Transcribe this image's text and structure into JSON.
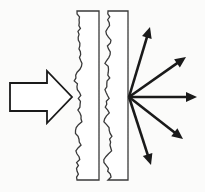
{
  "figure": {
    "title": "Wave scattering from a rough double-layer barrier",
    "domain": "diagram",
    "canvas": {
      "width": 205,
      "height": 192
    },
    "background_color": "#fbfbfa",
    "ink_color": "#1a1a1a",
    "line_width": 1.4
  },
  "incoming": {
    "label": "incident-beam",
    "shape": "hollow-block-arrow",
    "direction": "right",
    "fill": "#ffffff",
    "stroke": "#1a1a1a",
    "geometry": {
      "tail_x": 10,
      "tip_x": 72,
      "center_y": 97,
      "shaft_half_height": 14,
      "head_half_height": 26,
      "head_start_x": 47
    }
  },
  "slabs": [
    {
      "label": "slab-one",
      "rough_edge": "left",
      "straight_edge": "right",
      "x_left": 77,
      "x_right": 99,
      "y_top": 11,
      "y_bottom": 180,
      "fill": "#ffffff",
      "stroke": "#3a3a3a",
      "roughness_amplitude": 5,
      "roughness_segments": 58
    },
    {
      "label": "slab-two",
      "rough_edge": "left",
      "straight_edge": "right",
      "x_left": 108,
      "x_right": 128,
      "y_top": 11,
      "y_bottom": 180,
      "fill": "#ffffff",
      "stroke": "#3a3a3a",
      "roughness_amplitude": 5,
      "roughness_segments": 58
    }
  ],
  "scatter": {
    "label": "scattered-rays",
    "origin": {
      "x": 129,
      "y": 97
    },
    "stroke": "#1a1a1a",
    "line_width": 2.6,
    "head_length": 11,
    "head_half_width": 5,
    "count": 5,
    "rays": [
      {
        "label": "ray-up-steep",
        "tip_x": 150,
        "tip_y": 27,
        "angle_deg": -73
      },
      {
        "label": "ray-up-diagonal",
        "tip_x": 186,
        "tip_y": 57,
        "angle_deg": -39
      },
      {
        "label": "ray-horizontal",
        "tip_x": 197,
        "tip_y": 97,
        "angle_deg": 0
      },
      {
        "label": "ray-down-diagonal",
        "tip_x": 183,
        "tip_y": 139,
        "angle_deg": 39
      },
      {
        "label": "ray-down-steep",
        "tip_x": 151,
        "tip_y": 165,
        "angle_deg": 69
      }
    ]
  }
}
